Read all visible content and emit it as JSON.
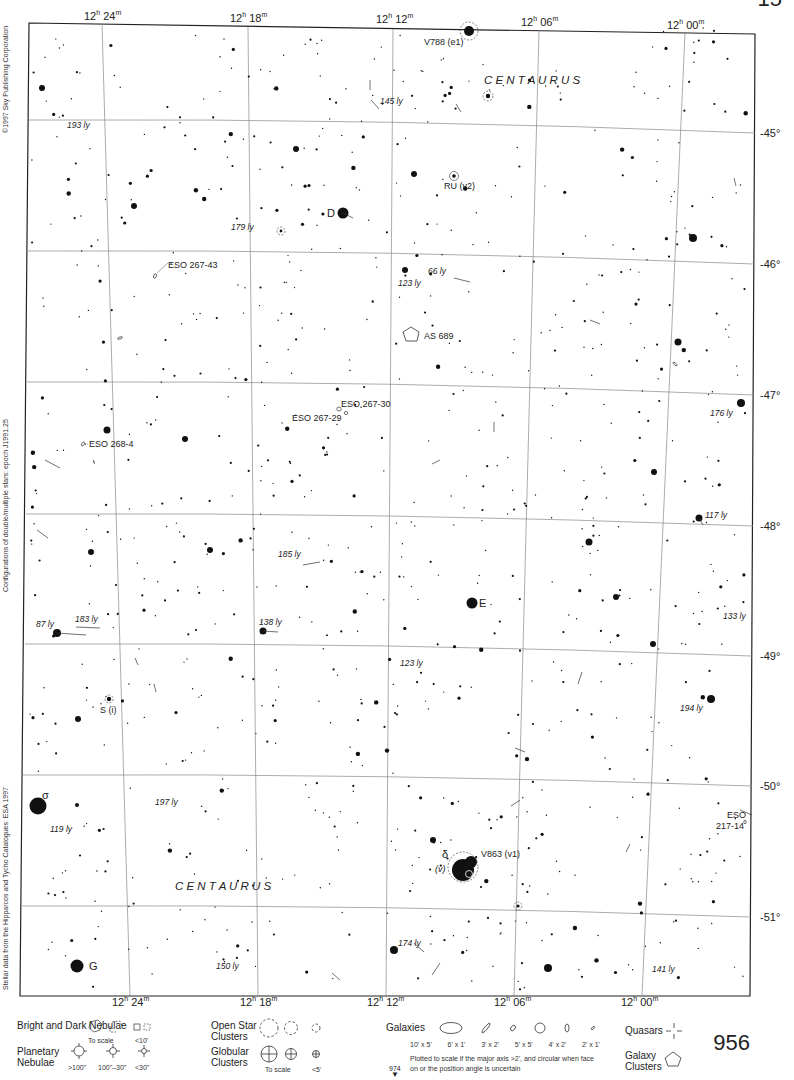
{
  "header": {
    "corner_page_fragment": "15",
    "ra_labels_top": [
      "12h 24m",
      "12h 18m",
      "12h 12m",
      "12h 06m",
      "12h 00m"
    ],
    "ra_labels_bottom": [
      "12h 24m",
      "12h 18m",
      "12h 12m",
      "12h 06m",
      "12h 00m"
    ]
  },
  "dec_labels": [
    "-45°",
    "-46°",
    "-47°",
    "-48°",
    "-49°",
    "-50°",
    "-51°"
  ],
  "side_credits": {
    "copyright": "©1997 Sky Publishing Corporation",
    "configurations": "Configurations of double/multiple stars: epoch J1991.25",
    "stellar_data": "Stellar data from the Hipparcos and Tycho Catalogues: ESA 1997"
  },
  "constellation_labels": [
    "C E N T A U R U S",
    "C E N T A U R U S"
  ],
  "objects": {
    "stars": [
      {
        "name": "V788 (e1)",
        "type": "variable"
      },
      {
        "name": "RU (v2)",
        "type": "variable"
      },
      {
        "name": "D",
        "type": "star"
      },
      {
        "name": "E",
        "type": "star"
      },
      {
        "name": "S (i)",
        "type": "variable"
      },
      {
        "name": "σ",
        "type": "star"
      },
      {
        "name": "δ",
        "type": "star"
      },
      {
        "name": "(v)",
        "type": "variable-note"
      },
      {
        "name": "V863 (v1)",
        "type": "variable"
      },
      {
        "name": "G",
        "type": "star"
      }
    ],
    "deep_sky": [
      {
        "name": "ESO 267-43",
        "type": "galaxy"
      },
      {
        "name": "ESO 268-4",
        "type": "galaxy"
      },
      {
        "name": "ESO 267-30",
        "type": "galaxy"
      },
      {
        "name": "ESO 267-29",
        "type": "galaxy"
      },
      {
        "name": "AS 689",
        "type": "galaxy-cluster"
      },
      {
        "name": "ESO 217-14",
        "type": "galaxy"
      }
    ],
    "distances": [
      "193 ly",
      "145 ly",
      "179 ly",
      "66 ly",
      "123 ly",
      "176 ly",
      "117 ly",
      "185 ly",
      "87 ly",
      "183 ly",
      "138 ly",
      "133 ly",
      "123 ly",
      "194 ly",
      "197 ly",
      "119 ly",
      "174 ly",
      "150 ly",
      "141 ly"
    ]
  },
  "legend": {
    "nebulae": {
      "title": "Bright and Dark Nebulae",
      "notes": [
        "To scale",
        "<10'"
      ]
    },
    "planetary": {
      "title": "Planetary Nebulae",
      "sizes": [
        ">100\"",
        "100\"–30\"",
        "<30\""
      ]
    },
    "open_clusters": {
      "title": "Open Star Clusters"
    },
    "globular": {
      "title": "Globular Clusters",
      "notes": [
        "To scale",
        "<5'"
      ]
    },
    "galaxies": {
      "title": "Galaxies",
      "sizes": [
        "10' x 5'",
        "6' x 1'",
        "3' x 2'",
        "5' x 5'",
        "4' x 2'",
        "2' x 1'"
      ],
      "note": "Plotted to scale if the major axis >2', and circular when face on or the position angle is uncertain"
    },
    "quasars": {
      "title": "Quasars"
    },
    "galaxy_clusters": {
      "title": "Galaxy Clusters"
    }
  },
  "footer": {
    "page_number": "956",
    "next_page": "974"
  }
}
